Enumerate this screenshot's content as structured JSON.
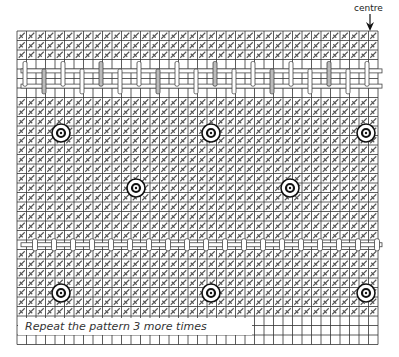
{
  "diagram": {
    "type": "cross-stitch chart",
    "centre_label": "centre",
    "caption": "Repeat the pattern 3 more times",
    "grid": {
      "left": 17,
      "top": 31,
      "cell": 9.5,
      "cols": 38,
      "rows": 33,
      "line_color": "#333333"
    },
    "stitched_area": {
      "col_start": 0,
      "col_end": 37,
      "row_start": 0,
      "row_end": 29
    },
    "woven_band": {
      "rows": [
        3,
        4,
        5,
        6
      ],
      "label": "woven bars band"
    },
    "woven_row": {
      "row": 22,
      "label": "single woven bar row"
    },
    "eyelets": [
      {
        "cx": 61,
        "cy": 133
      },
      {
        "cx": 211,
        "cy": 133
      },
      {
        "cx": 366,
        "cy": 133
      },
      {
        "cx": 136,
        "cy": 188
      },
      {
        "cx": 290,
        "cy": 188
      },
      {
        "cx": 61,
        "cy": 293
      },
      {
        "cx": 211,
        "cy": 293
      },
      {
        "cx": 366,
        "cy": 293
      }
    ],
    "colors": {
      "grid": "#333333",
      "stitch": "#555555",
      "bar_fill": "#ffffff",
      "bar_stroke": "#444444",
      "eyelet": "#111111",
      "background": "#ffffff"
    }
  }
}
